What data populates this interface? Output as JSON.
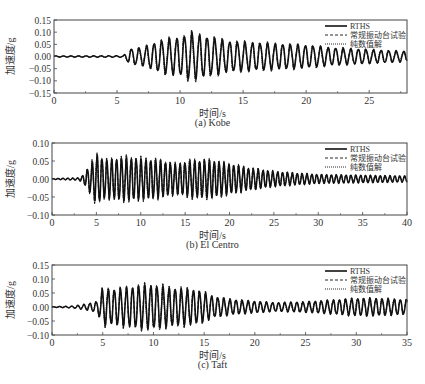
{
  "chart_data": [
    {
      "type": "line",
      "title": "(a) Kobe",
      "xlabel": "时间/s",
      "ylabel": "加速度/g",
      "xlim": [
        0,
        28
      ],
      "ylim": [
        -0.15,
        0.15
      ],
      "xticks": [
        0,
        5,
        10,
        15,
        20,
        25
      ],
      "yticks": [
        -0.15,
        -0.1,
        -0.05,
        0.0,
        0.05,
        0.1,
        0.15
      ],
      "ytick_labels": [
        "-0.15",
        "-0.10",
        "-0.05",
        "0.00",
        "0.05",
        "0.10",
        "0.15"
      ],
      "legend": [
        "RTHS",
        "常规振动台试验",
        "纯数值解"
      ],
      "legend_position": "upper right",
      "grid": false,
      "envelope": {
        "x": [
          0,
          5.5,
          6,
          7,
          8,
          9,
          10,
          10.8,
          12,
          14,
          16,
          18,
          20,
          22,
          24,
          26,
          28
        ],
        "amplitude": [
          0.002,
          0.003,
          0.03,
          0.035,
          0.055,
          0.07,
          0.075,
          0.095,
          0.08,
          0.06,
          0.055,
          0.05,
          0.045,
          0.035,
          0.03,
          0.025,
          0.02
        ]
      },
      "period_s": 0.6
    },
    {
      "type": "line",
      "title": "(b) El Centro",
      "xlabel": "时间/s",
      "ylabel": "加速度/g",
      "xlim": [
        0,
        40
      ],
      "ylim": [
        -0.1,
        0.1
      ],
      "xticks": [
        0,
        5,
        10,
        15,
        20,
        25,
        30,
        35,
        40
      ],
      "yticks": [
        -0.1,
        -0.05,
        0.0,
        0.05,
        0.1
      ],
      "ytick_labels": [
        "-0.10",
        "-0.05",
        "0.00",
        "0.05",
        "0.10"
      ],
      "legend": [
        "RTHS",
        "常规振动台试验",
        "纯数值解"
      ],
      "legend_position": "upper right",
      "grid": false,
      "envelope": {
        "x": [
          0,
          3,
          3.5,
          4.5,
          5,
          6,
          8,
          10,
          12,
          14,
          16,
          18,
          20,
          22,
          25,
          28,
          30,
          35,
          40
        ],
        "amplitude": [
          0.001,
          0.003,
          0.01,
          0.045,
          0.068,
          0.05,
          0.058,
          0.055,
          0.05,
          0.04,
          0.05,
          0.05,
          0.04,
          0.03,
          0.02,
          0.015,
          0.012,
          0.01,
          0.008
        ]
      },
      "period_s": 0.55
    },
    {
      "type": "line",
      "title": "(c) Taft",
      "xlabel": "时间/s",
      "ylabel": "加速度/g",
      "xlim": [
        0,
        35
      ],
      "ylim": [
        -0.1,
        0.15
      ],
      "xticks": [
        0,
        5,
        10,
        15,
        20,
        25,
        30,
        35
      ],
      "yticks": [
        -0.1,
        -0.05,
        0.0,
        0.05,
        0.1,
        0.15
      ],
      "ytick_labels": [
        "-0.10",
        "-0.05",
        "0.00",
        "0.05",
        "0.10",
        "0.15"
      ],
      "legend": [
        "RTHS",
        "常规振动台试验",
        "纯数值解"
      ],
      "legend_position": "upper right",
      "grid": false,
      "envelope": {
        "x": [
          0,
          2,
          3,
          4,
          4.5,
          5,
          6,
          8,
          9,
          10,
          12,
          14,
          15,
          16,
          18,
          20,
          22,
          25,
          28,
          30,
          32,
          35
        ],
        "amplitude": [
          0.001,
          0.003,
          0.008,
          0.015,
          0.02,
          0.065,
          0.06,
          0.07,
          0.075,
          0.075,
          0.065,
          0.06,
          0.05,
          0.035,
          0.025,
          0.02,
          0.015,
          0.018,
          0.025,
          0.03,
          0.03,
          0.025
        ]
      },
      "period_s": 0.6
    }
  ],
  "panels": [
    {
      "caption": "(a) Kobe",
      "xlabel": "时间/s",
      "ylabel": "加速度/g",
      "legend": [
        {
          "label": "RTHS",
          "style": "solid"
        },
        {
          "label": "常规振动台试验",
          "style": "dashed"
        },
        {
          "label": "纯数值解",
          "style": "dotted"
        }
      ]
    },
    {
      "caption": "(b) El Centro",
      "xlabel": "时间/s",
      "ylabel": "加速度/g",
      "legend": [
        {
          "label": "RTHS",
          "style": "solid"
        },
        {
          "label": "常规振动台试验",
          "style": "dashed"
        },
        {
          "label": "纯数值解",
          "style": "dotted"
        }
      ]
    },
    {
      "caption": "(c) Taft",
      "xlabel": "时间/s",
      "ylabel": "加速度/g",
      "legend": [
        {
          "label": "RTHS",
          "style": "solid"
        },
        {
          "label": "常规振动台试验",
          "style": "dashed"
        },
        {
          "label": "纯数值解",
          "style": "dotted"
        }
      ]
    }
  ],
  "colors": {
    "line": "#111111",
    "axis": "#444444",
    "text": "#333333"
  }
}
